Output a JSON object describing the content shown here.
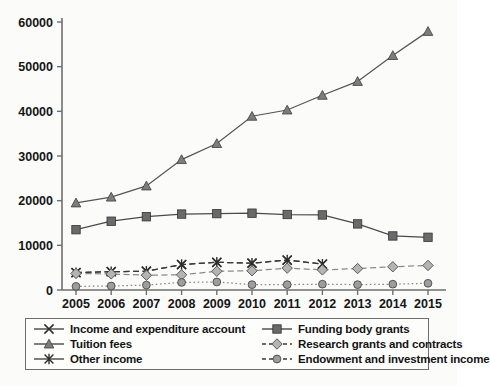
{
  "chart_data": {
    "type": "line",
    "title": "",
    "xlabel": "",
    "ylabel": "",
    "categories": [
      2005,
      2006,
      2007,
      2008,
      2009,
      2010,
      2011,
      2012,
      2013,
      2014,
      2015
    ],
    "xtick_labels": [
      "2005",
      "2006",
      "2007",
      "2008",
      "2009",
      "2010",
      "2011",
      "2012",
      "2013",
      "2014",
      "2015"
    ],
    "ytick_labels": [
      "0",
      "10000",
      "20000",
      "30000",
      "40000",
      "50000",
      "60000"
    ],
    "yticks": [
      0,
      10000,
      20000,
      30000,
      40000,
      50000,
      60000
    ],
    "ylim": [
      0,
      60000
    ],
    "grid": false,
    "legend_position": "below",
    "series": [
      {
        "name": "Income and expenditure account",
        "marker": "x-cross",
        "line": "dashed",
        "color": "#3a3a3a",
        "values": [
          3900,
          4100,
          4200,
          5700,
          6200,
          6000,
          6700,
          5800,
          null,
          null,
          null
        ]
      },
      {
        "name": "Tuition fees",
        "marker": "triangle",
        "line": "solid",
        "color": "#555555",
        "values": [
          19500,
          20800,
          23300,
          29200,
          32800,
          38900,
          40300,
          43600,
          46700,
          52500,
          57900
        ]
      },
      {
        "name": "Other income",
        "marker": "asterisk",
        "line": "dashed",
        "color": "#3a3a3a",
        "values": [
          3900,
          4100,
          4200,
          5700,
          6200,
          6000,
          6700,
          5800,
          null,
          null,
          null
        ]
      },
      {
        "name": "Funding body grants",
        "marker": "square",
        "line": "solid",
        "color": "#4a4a4a",
        "values": [
          13500,
          15400,
          16400,
          17000,
          17100,
          17200,
          16900,
          16800,
          14800,
          12100,
          11800
        ]
      },
      {
        "name": "Research grants and contracts",
        "marker": "diamond",
        "line": "dashed",
        "color": "#8a8a8a",
        "values": [
          3700,
          3600,
          3300,
          3400,
          4200,
          4300,
          4900,
          4500,
          4800,
          5200,
          5500
        ]
      },
      {
        "name": "Endowment and investment income",
        "marker": "circle",
        "line": "dotted",
        "color": "#8a8a8a",
        "values": [
          800,
          900,
          1100,
          1700,
          1800,
          1200,
          1200,
          1300,
          1200,
          1300,
          1500
        ]
      }
    ]
  },
  "legend": {
    "items": [
      {
        "label": "Income and expenditure account",
        "marker": "x-cross-icon",
        "line": "solid"
      },
      {
        "label": "Funding body grants",
        "marker": "square-icon",
        "line": "solid"
      },
      {
        "label": "Tuition fees",
        "marker": "triangle-icon",
        "line": "solid"
      },
      {
        "label": "Research grants and contracts",
        "marker": "diamond-icon",
        "line": "dashed"
      },
      {
        "label": "Other income",
        "marker": "asterisk-icon",
        "line": "solid"
      },
      {
        "label": "Endowment and investment income",
        "marker": "circle-icon",
        "line": "dashed"
      }
    ]
  },
  "colors": {
    "axis": "#6f6f6f",
    "text": "#141414",
    "marker_fill_dark": "#6a6a6a",
    "marker_fill_light": "#b4b4b4",
    "background": "#fbfbfa"
  }
}
